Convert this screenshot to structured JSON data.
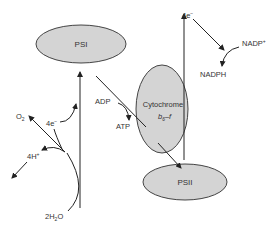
{
  "diagram": {
    "nodes": {
      "psi": "PSI",
      "psii": "PSII",
      "cytochrome_line1": "Cytochrome",
      "cytochrome_line2_main": "b",
      "cytochrome_line2_sub": "6",
      "cytochrome_line2_rest": "–f"
    },
    "labels": {
      "o2_main": "O",
      "o2_sub": "2",
      "electrons_left": "4e",
      "electrons_left_sup": "−",
      "protons": "4H",
      "protons_sup": "+",
      "water_pre": "2H",
      "water_sub": "2",
      "water_post": "O",
      "adp": "ADP",
      "atp": "ATP",
      "electrons_top": "4e",
      "electrons_top_sup": "−",
      "nadp": "NADP",
      "nadp_sup": "+",
      "nadph": "NADPH"
    },
    "colors": {
      "ellipse_fill": "#d4d4d4",
      "stroke": "#222222",
      "text": "#333333"
    }
  }
}
